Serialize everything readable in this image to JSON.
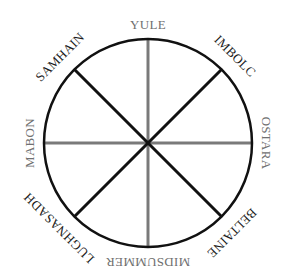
{
  "diagram": {
    "type": "wheel-of-the-year",
    "center": [
      148,
      143
    ],
    "radius": 104,
    "colors": {
      "circle": "#111111",
      "cardinal_spoke": "#7a7a7a",
      "diagonal_spoke": "#111111",
      "cardinal_label": "#707070",
      "diagonal_label": "#1a1a1a",
      "background": "#ffffff"
    },
    "labels": {
      "top": "YULE",
      "top_right": "IMBOLC",
      "right": "OSTARA",
      "bottom_right": "BELTAINE",
      "bottom": "MIDSUMMER",
      "bottom_left": "LUGHNASADH",
      "left": "MABON",
      "top_left": "SAMHAIN"
    }
  }
}
